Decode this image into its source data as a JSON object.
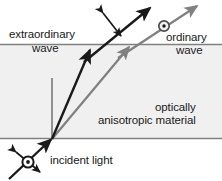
{
  "figure": {
    "background_color": "#ffffff",
    "material_fill": "#f0f0f0",
    "boundary_color": "#808080",
    "extraordinary_ray_color": "#1a1a1a",
    "ordinary_ray_color": "#808080",
    "normal_line_color": "#808080"
  },
  "labels": {
    "extraordinary": "extraordinary",
    "extraordinary_wave": "wave",
    "ordinary": "ordinary",
    "ordinary_wave": "wave",
    "optically": "optically",
    "anisotropic_material": "anisotropic material",
    "incident_light": "incident light"
  },
  "symbols": {
    "incident_polarization_circle_dot": "circle-dot-icon",
    "ordinary_polarization_circle_dot": "circle-dot-icon",
    "incident_polarization_double_arrow": "double-headed-arrow-icon",
    "extraordinary_polarization_double_arrow": "double-headed-arrow-icon"
  },
  "geometry": {
    "material_region": {
      "top": 44,
      "bottom": 138,
      "left": 0,
      "right": 222
    },
    "interface_point": {
      "x": 52,
      "y": 139
    },
    "incident_ray": {
      "from": {
        "x": 9,
        "y": 179
      },
      "to": {
        "x": 52,
        "y": 139
      }
    },
    "normal_line": {
      "from": {
        "x": 52,
        "y": 78
      },
      "to": {
        "x": 52,
        "y": 139
      }
    },
    "extraordinary_ray_inside": {
      "from": {
        "x": 52,
        "y": 139
      },
      "to": {
        "x": 90,
        "y": 50
      }
    },
    "extraordinary_ray_outside": {
      "from": {
        "x": 86,
        "y": 60
      },
      "to": {
        "x": 150,
        "y": 7
      }
    },
    "ordinary_ray_inside": {
      "from": {
        "x": 52,
        "y": 139
      },
      "to": {
        "x": 129,
        "y": 47
      }
    },
    "ordinary_ray_outside": {
      "from": {
        "x": 120,
        "y": 57
      },
      "to": {
        "x": 197,
        "y": 5
      }
    }
  }
}
